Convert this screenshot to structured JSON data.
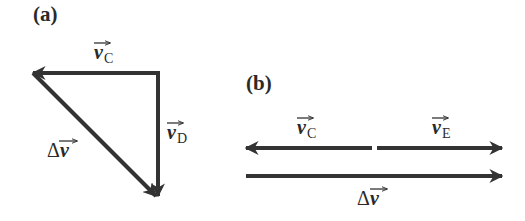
{
  "panel_a": {
    "label": "(a)",
    "vectors": [
      {
        "id": "v_C",
        "symbol": "v",
        "subscript": "C",
        "direction": "left"
      },
      {
        "id": "v_D",
        "symbol": "v",
        "subscript": "D",
        "direction": "down"
      },
      {
        "id": "delta_v",
        "symbol": "v",
        "prefix": "Δ",
        "direction": "down-right"
      }
    ]
  },
  "panel_b": {
    "label": "(b)",
    "vectors": [
      {
        "id": "v_C",
        "symbol": "v",
        "subscript": "C",
        "direction": "left"
      },
      {
        "id": "v_E",
        "symbol": "v",
        "subscript": "E",
        "direction": "right"
      },
      {
        "id": "delta_v",
        "symbol": "v",
        "prefix": "Δ",
        "direction": "right"
      }
    ]
  },
  "colors": {
    "arrow": "#333333",
    "text": "#2a2a2a"
  }
}
